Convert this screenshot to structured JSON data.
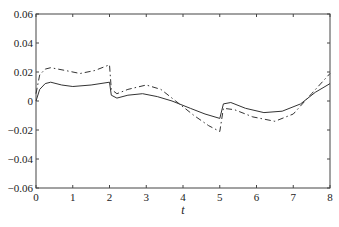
{
  "chart_data": {
    "type": "line",
    "title": "",
    "xlabel": "t",
    "ylabel": "",
    "xlim": [
      0,
      8
    ],
    "ylim": [
      -0.06,
      0.06
    ],
    "grid": false,
    "legend": null,
    "x_ticks": [
      "0",
      "1",
      "2",
      "3",
      "4",
      "5",
      "6",
      "7",
      "8"
    ],
    "y_ticks": [
      "0.06",
      "0.04",
      "0.02",
      "0",
      "-0.02",
      "-0.04",
      "-0.06"
    ],
    "series": [
      {
        "name": "solid",
        "style": "solid",
        "x": [
          0,
          0.1,
          0.25,
          0.4,
          0.7,
          1.0,
          1.5,
          2.0,
          2.0,
          2.05,
          2.2,
          2.5,
          2.9,
          3.3,
          3.7,
          4.2,
          4.6,
          5.0,
          5.0,
          5.1,
          5.3,
          5.7,
          6.2,
          6.7,
          7.2,
          7.6,
          8.0
        ],
        "values": [
          0.0,
          0.008,
          0.012,
          0.013,
          0.011,
          0.01,
          0.011,
          0.013,
          0.013,
          0.004,
          0.002,
          0.004,
          0.005,
          0.003,
          0.0,
          -0.005,
          -0.009,
          -0.012,
          -0.012,
          -0.002,
          -0.001,
          -0.005,
          -0.008,
          -0.007,
          -0.002,
          0.006,
          0.012
        ]
      },
      {
        "name": "dashed",
        "style": "dash-dot",
        "x": [
          0,
          0.1,
          0.25,
          0.4,
          0.8,
          1.2,
          1.6,
          2.0,
          2.0,
          2.05,
          2.2,
          2.5,
          3.0,
          3.4,
          3.8,
          4.3,
          4.7,
          5.0,
          5.0,
          5.1,
          5.4,
          5.9,
          6.5,
          7.0,
          7.5,
          8.0
        ],
        "values": [
          0.005,
          0.018,
          0.022,
          0.023,
          0.021,
          0.019,
          0.021,
          0.025,
          0.025,
          0.008,
          0.005,
          0.008,
          0.011,
          0.008,
          0.0,
          -0.01,
          -0.017,
          -0.021,
          -0.021,
          -0.005,
          -0.006,
          -0.011,
          -0.014,
          -0.009,
          0.005,
          0.019
        ]
      }
    ]
  },
  "plot": {
    "left": 36,
    "right": 330,
    "top": 14,
    "bottom": 188,
    "line_color": "#333333",
    "axis_color": "#444444"
  }
}
